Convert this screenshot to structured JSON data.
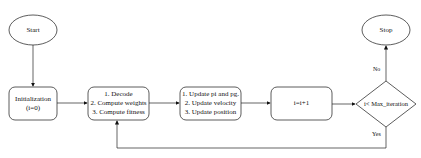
{
  "diagram": {
    "type": "flowchart",
    "nodes": {
      "start": {
        "shape": "ellipse",
        "label": "Start"
      },
      "init": {
        "shape": "rounded-rect",
        "lines": [
          "Initialization",
          "(i=0)"
        ]
      },
      "evaluate": {
        "shape": "rounded-rect",
        "lines": [
          "1. Decode",
          "2. Compute weights",
          "3. Compute fitness"
        ]
      },
      "update": {
        "shape": "rounded-rect",
        "lines": [
          "1. Update pi and pg.",
          "2. Update velocity",
          "3. Update position"
        ]
      },
      "increment": {
        "shape": "rounded-rect",
        "label": "i=i+1"
      },
      "decision": {
        "shape": "diamond",
        "label": "i< Max_iteration"
      },
      "stop": {
        "shape": "ellipse",
        "label": "Stop"
      }
    },
    "edges": [
      {
        "from": "start",
        "to": "init",
        "label": ""
      },
      {
        "from": "init",
        "to": "evaluate",
        "label": ""
      },
      {
        "from": "evaluate",
        "to": "update",
        "label": ""
      },
      {
        "from": "update",
        "to": "increment",
        "label": ""
      },
      {
        "from": "increment",
        "to": "decision",
        "label": ""
      },
      {
        "from": "decision",
        "to": "stop",
        "label": "No"
      },
      {
        "from": "decision",
        "to": "evaluate",
        "label": "Yes"
      }
    ],
    "colors": {
      "stroke": "#333333",
      "fill": "#ffffff",
      "text": "#111111"
    }
  }
}
